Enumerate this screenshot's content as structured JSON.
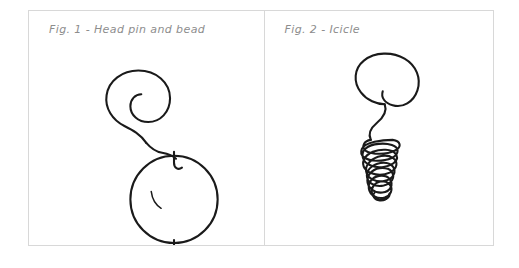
{
  "sheet": {
    "background_color": "#ffffff",
    "border_color": "#d8d8d8",
    "ink_color": "#1a1a1a",
    "caption_color": "#8d8d8d"
  },
  "panels": [
    {
      "id": "fig-1",
      "caption": "Fig. 1 - Head pin and bead",
      "figure_number": "Fig. 1",
      "figure_title": "Head pin and bead",
      "parts": [
        {
          "name": "spiral-wire-loop",
          "description": "open spiral coil at top of the head pin"
        },
        {
          "name": "wire-stem",
          "description": "S-curved wire descending from spiral to bead"
        },
        {
          "name": "bead-entry-hook",
          "description": "small hook where wire enters the bead"
        },
        {
          "name": "bead",
          "description": "round bead threaded on the pin"
        },
        {
          "name": "bead-highlight",
          "description": "small curved highlight arc inside the bead"
        },
        {
          "name": "pin-head",
          "description": "flat T-shaped head at the bottom of the pin"
        }
      ]
    },
    {
      "id": "fig-2",
      "caption": "Fig. 2 - Icicle",
      "figure_number": "Fig. 2",
      "figure_title": "Icicle",
      "parts": [
        {
          "name": "spiral-wire-loop",
          "description": "large round spiral at the top of the icicle"
        },
        {
          "name": "connector-curve",
          "description": "short S-curve joining the spiral to the coil"
        },
        {
          "name": "tapered-coil",
          "description": "tapering helical coil forming the icicle body"
        },
        {
          "name": "coil-tip",
          "description": "narrow tip at the bottom of the coil"
        }
      ],
      "coil_loop_count": 10
    }
  ]
}
